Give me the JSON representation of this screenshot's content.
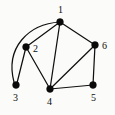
{
  "figure": {
    "type": "undirected-graph-diagram",
    "background_color": "#fbfbf9",
    "ink_color": "#101010",
    "canvas": {
      "width": 115,
      "height": 115
    }
  },
  "chart_data": {
    "type": "diagram",
    "title": "",
    "nodes": [
      {
        "id": "1",
        "label": "1",
        "x": 60,
        "y": 22,
        "label_x": 58,
        "label_y": 5,
        "radius": 3.4
      },
      {
        "id": "2",
        "label": "2",
        "x": 26,
        "y": 47,
        "label_x": 33,
        "label_y": 44,
        "radius": 3.4
      },
      {
        "id": "3",
        "label": "3",
        "x": 16,
        "y": 85,
        "label_x": 13,
        "label_y": 93,
        "radius": 3.4
      },
      {
        "id": "4",
        "label": "4",
        "x": 50,
        "y": 89,
        "label_x": 47,
        "label_y": 97,
        "radius": 3.4
      },
      {
        "id": "5",
        "label": "5",
        "x": 93,
        "y": 85,
        "label_x": 91,
        "label_y": 93,
        "radius": 3.4
      },
      {
        "id": "6",
        "label": "6",
        "x": 95,
        "y": 45,
        "label_x": 102,
        "label_y": 41,
        "radius": 3.4
      }
    ],
    "edges": [
      {
        "from": "1",
        "to": "2",
        "shape": "line",
        "path": "M 60 22 L 26 47"
      },
      {
        "from": "1",
        "to": "4",
        "shape": "line",
        "path": "M 60 22 L 50 89"
      },
      {
        "from": "1",
        "to": "6",
        "shape": "line",
        "path": "M 60 22 L 95 45"
      },
      {
        "from": "1",
        "to": "3",
        "shape": "curve",
        "path": "M 60 22 C 28 24 5 48 14 82"
      },
      {
        "from": "2",
        "to": "3",
        "shape": "line",
        "path": "M 26 47 L 17 83"
      },
      {
        "from": "2",
        "to": "4",
        "shape": "line",
        "path": "M 26 47 L 50 89"
      },
      {
        "from": "4",
        "to": "5",
        "shape": "line",
        "path": "M 50 89 L 93 85"
      },
      {
        "from": "4",
        "to": "6",
        "shape": "line",
        "path": "M 50 89 L 95 45"
      },
      {
        "from": "5",
        "to": "6",
        "shape": "line",
        "path": "M 93 85 L 95 45"
      }
    ],
    "node_count": 6,
    "edge_count": 9,
    "degrees": {
      "1": 4,
      "2": 3,
      "3": 2,
      "4": 4,
      "5": 2,
      "6": 3
    }
  }
}
